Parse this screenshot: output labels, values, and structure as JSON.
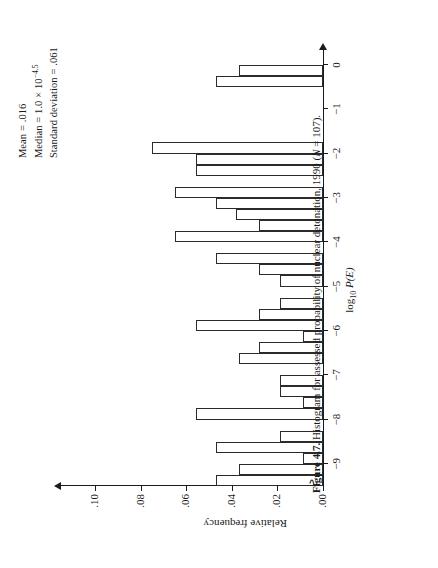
{
  "figure": {
    "caption_label": "Figure 4.7.",
    "caption_text": "Histogram for assessed probability of nuclear detonation, 1990 (",
    "caption_n_symbol": "N",
    "caption_n_value": " = 107).",
    "orientation": "rotated-90-ccw"
  },
  "stats": {
    "mean_label": "Mean = .016",
    "median_label_pre": "Median = 1.0 × 10",
    "median_exponent": "−4.5",
    "sd_label": "Standard deviation = .061"
  },
  "chart_data": {
    "type": "bar",
    "title": "Histogram for assessed probability of nuclear detonation, 1990 (N = 107)",
    "xlabel": "log10 P(E)",
    "ylabel": "Relative frequency",
    "xlabel_main": "log",
    "xlabel_sub": "10",
    "xlabel_ital": "P(E)",
    "xlim": [
      -9.5,
      0.2
    ],
    "ylim": [
      0.0,
      0.112
    ],
    "grid": false,
    "legend": "none",
    "bin_width": 0.25,
    "axis_break_y": true,
    "xticks": [
      0,
      -1,
      -2,
      -3,
      -4,
      -5,
      -6,
      -7,
      -8,
      -9
    ],
    "xticklabels": [
      "0",
      "−1",
      "−2",
      "−3",
      "−4",
      "−5",
      "−6",
      "−7",
      "−8",
      "−9"
    ],
    "yticks": [
      0.0,
      0.02,
      0.04,
      0.06,
      0.08,
      0.1
    ],
    "yticklabels": [
      ".00",
      ".02",
      ".04",
      ".06",
      ".08",
      ".10"
    ],
    "bins": [
      {
        "x": -0.125,
        "value": 0.037
      },
      {
        "x": -0.375,
        "value": 0.047
      },
      {
        "x": -0.625,
        "value": 0.0
      },
      {
        "x": -0.875,
        "value": 0.0
      },
      {
        "x": -1.125,
        "value": 0.0
      },
      {
        "x": -1.375,
        "value": 0.0
      },
      {
        "x": -1.625,
        "value": 0.0
      },
      {
        "x": -1.875,
        "value": 0.075
      },
      {
        "x": -2.125,
        "value": 0.056
      },
      {
        "x": -2.375,
        "value": 0.056
      },
      {
        "x": -2.625,
        "value": 0.0
      },
      {
        "x": -2.875,
        "value": 0.065
      },
      {
        "x": -3.125,
        "value": 0.047
      },
      {
        "x": -3.375,
        "value": 0.038
      },
      {
        "x": -3.625,
        "value": 0.028
      },
      {
        "x": -3.875,
        "value": 0.065
      },
      {
        "x": -4.125,
        "value": 0.0
      },
      {
        "x": -4.375,
        "value": 0.047
      },
      {
        "x": -4.625,
        "value": 0.028
      },
      {
        "x": -4.875,
        "value": 0.019
      },
      {
        "x": -5.125,
        "value": 0.0
      },
      {
        "x": -5.375,
        "value": 0.019
      },
      {
        "x": -5.625,
        "value": 0.028
      },
      {
        "x": -5.875,
        "value": 0.056
      },
      {
        "x": -6.125,
        "value": 0.009
      },
      {
        "x": -6.375,
        "value": 0.028
      },
      {
        "x": -6.625,
        "value": 0.037
      },
      {
        "x": -6.875,
        "value": 0.0
      },
      {
        "x": -7.125,
        "value": 0.019
      },
      {
        "x": -7.375,
        "value": 0.019
      },
      {
        "x": -7.625,
        "value": 0.009
      },
      {
        "x": -7.875,
        "value": 0.056
      },
      {
        "x": -8.125,
        "value": 0.0
      },
      {
        "x": -8.375,
        "value": 0.019
      },
      {
        "x": -8.625,
        "value": 0.047
      },
      {
        "x": -8.875,
        "value": 0.009
      },
      {
        "x": -9.125,
        "value": 0.037
      },
      {
        "x": -9.375,
        "value": 0.047
      }
    ]
  }
}
